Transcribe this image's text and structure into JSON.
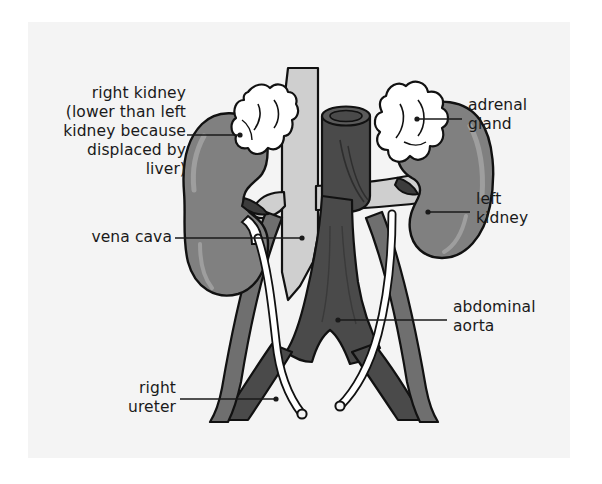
{
  "figure": {
    "panel_background": "#f4f4f4",
    "page_background": "#ffffff"
  },
  "palette": {
    "kidney_fill": "#808080",
    "kidney_outline": "#111111",
    "adrenal_fill": "#ffffff",
    "adrenal_outline": "#111111",
    "vena_cava_fill": "#cfcfcf",
    "aorta_fill": "#4a4a4a",
    "ureter_fill": "#ffffff",
    "leader_line": "#1a1a1a",
    "text": "#1a1a1a"
  },
  "labels": {
    "right_kidney": {
      "text": "right kidney\n(lower than left\nkidney because\ndisplaced by\nliver)",
      "align": "right"
    },
    "vena_cava": {
      "text": "vena cava",
      "align": "right"
    },
    "right_ureter": {
      "text": "right\nureter",
      "align": "right"
    },
    "adrenal_gland": {
      "text": "adrenal\ngland",
      "align": "left"
    },
    "left_kidney": {
      "text": "left\nkidney",
      "align": "left"
    },
    "abdominal_aorta": {
      "text": "abdominal\naorta",
      "align": "left"
    }
  },
  "structures": [
    {
      "name": "right-kidney",
      "side": "right",
      "color": "#808080"
    },
    {
      "name": "left-kidney",
      "side": "left",
      "color": "#808080"
    },
    {
      "name": "right-adrenal-gland",
      "side": "right",
      "color": "#ffffff"
    },
    {
      "name": "left-adrenal-gland",
      "side": "left",
      "color": "#ffffff"
    },
    {
      "name": "inferior-vena-cava",
      "color": "#cfcfcf"
    },
    {
      "name": "abdominal-aorta",
      "color": "#4a4a4a"
    },
    {
      "name": "right-ureter",
      "color": "#ffffff"
    },
    {
      "name": "left-ureter",
      "color": "#ffffff"
    },
    {
      "name": "right-common-iliac-artery",
      "color": "#4a4a4a"
    },
    {
      "name": "left-common-iliac-artery",
      "color": "#4a4a4a"
    },
    {
      "name": "right-renal-vessels",
      "color": "#808080"
    },
    {
      "name": "left-renal-vessels",
      "color": "#cfcfcf"
    }
  ]
}
